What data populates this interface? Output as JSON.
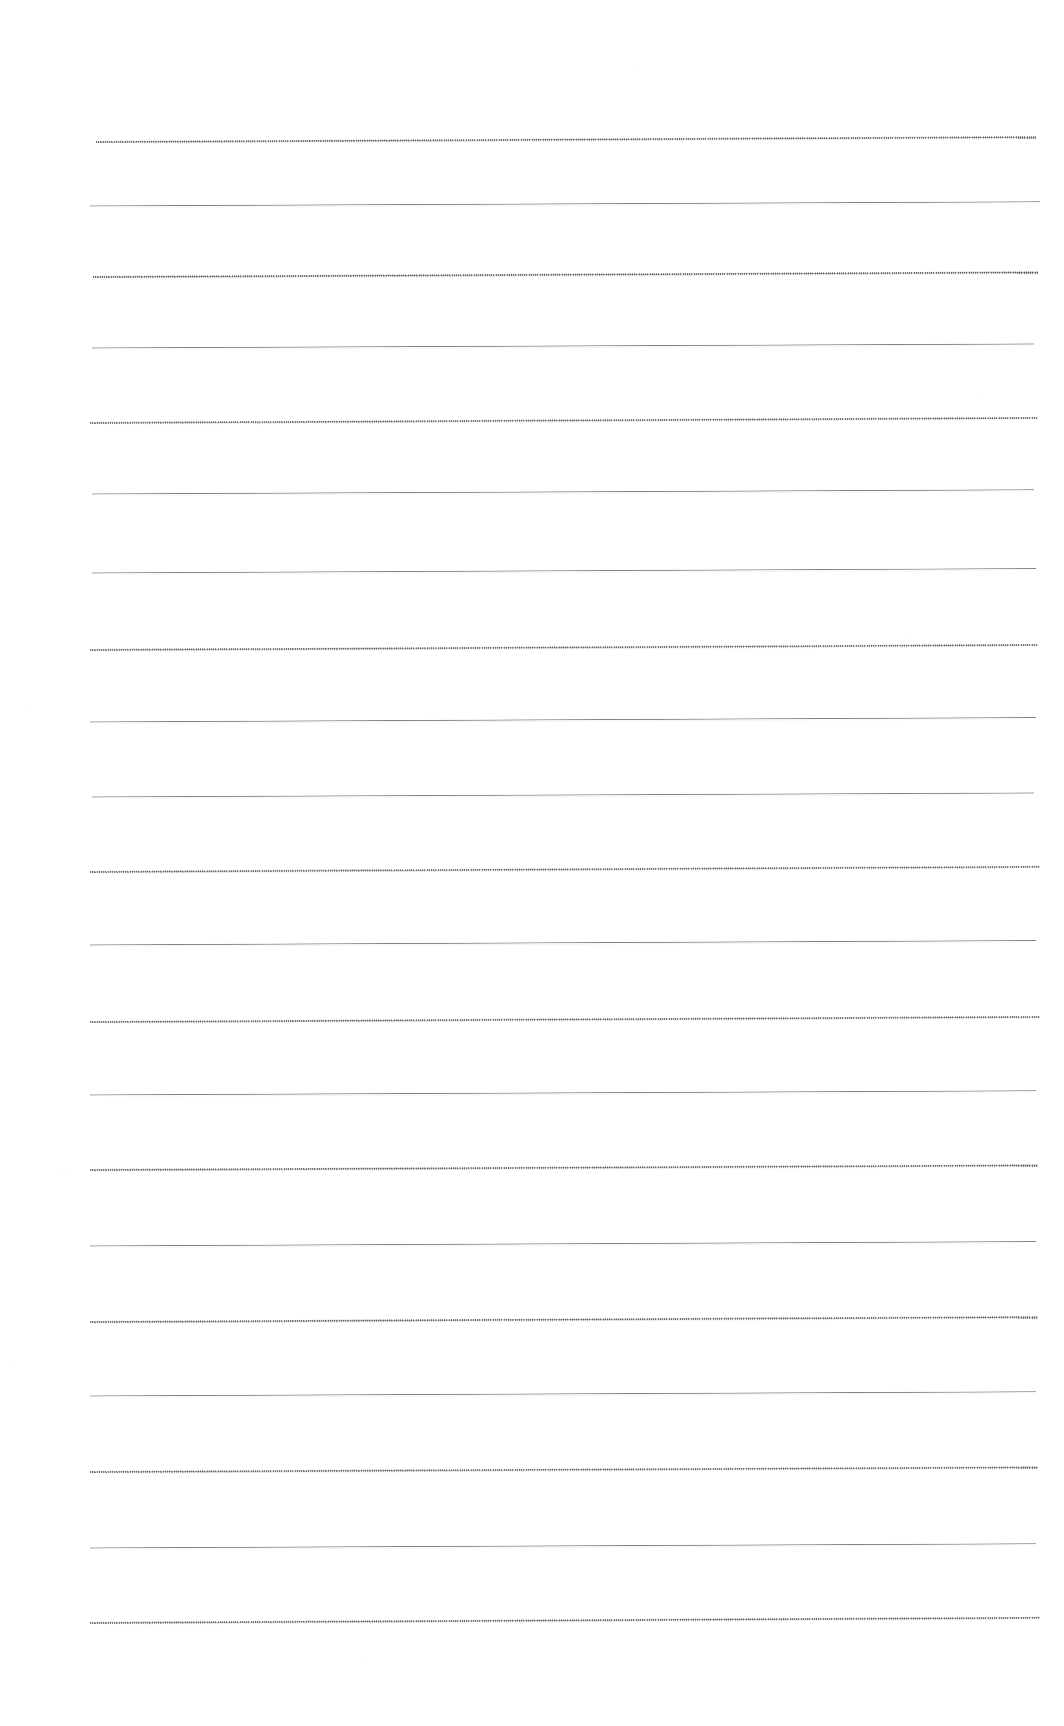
{
  "document": {
    "kind": "lined-paper-scan",
    "title": "Blank lined notebook page",
    "page_width": 1064,
    "page_height": 1726,
    "background_color": "#ffffff",
    "has_text_content": false,
    "visible_text": "",
    "margin": {
      "left": 96,
      "right": 1036,
      "top_first_line": 142,
      "bottom_last_line": 1623
    },
    "ruling": {
      "line_count": 19,
      "line_spacing_px": 82.3,
      "line_color": "#6a6a70",
      "line_thickness_px": 1,
      "line_start_x": 96,
      "line_end_x": 1036,
      "slope_px_over_span": -5,
      "style_note": "alternating fine solid / fine dotted scan texture"
    },
    "lines": [
      {
        "index": 1,
        "y": 142,
        "x_start": 96,
        "x_end": 1036,
        "tilt": -4.8,
        "style": "dotted",
        "opacity": 0.88,
        "content": ""
      },
      {
        "index": 2,
        "y": 206,
        "x_start": 90,
        "x_end": 1040,
        "tilt": -4.2,
        "style": "solid",
        "opacity": 0.92,
        "content": ""
      },
      {
        "index": 3,
        "y": 277,
        "x_start": 93,
        "x_end": 1038,
        "tilt": -4.6,
        "style": "dotted",
        "opacity": 0.9,
        "content": ""
      },
      {
        "index": 4,
        "y": 348,
        "x_start": 92,
        "x_end": 1034,
        "tilt": -4.0,
        "style": "solid",
        "opacity": 0.92,
        "content": ""
      },
      {
        "index": 5,
        "y": 423,
        "x_start": 90,
        "x_end": 1038,
        "tilt": -5.0,
        "style": "dotted",
        "opacity": 0.86,
        "content": ""
      },
      {
        "index": 6,
        "y": 494,
        "x_start": 92,
        "x_end": 1034,
        "tilt": -4.2,
        "style": "solid",
        "opacity": 0.92,
        "content": ""
      },
      {
        "index": 7,
        "y": 573,
        "x_start": 92,
        "x_end": 1036,
        "tilt": -4.4,
        "style": "solid",
        "opacity": 0.9,
        "content": ""
      },
      {
        "index": 8,
        "y": 650,
        "x_start": 90,
        "x_end": 1038,
        "tilt": -5.0,
        "style": "dotted",
        "opacity": 0.86,
        "content": ""
      },
      {
        "index": 9,
        "y": 722,
        "x_start": 90,
        "x_end": 1036,
        "tilt": -4.4,
        "style": "solid",
        "opacity": 0.92,
        "content": ""
      },
      {
        "index": 10,
        "y": 797,
        "x_start": 92,
        "x_end": 1034,
        "tilt": -4.0,
        "style": "solid",
        "opacity": 0.9,
        "content": ""
      },
      {
        "index": 11,
        "y": 872,
        "x_start": 90,
        "x_end": 1040,
        "tilt": -5.2,
        "style": "dotted",
        "opacity": 0.86,
        "content": ""
      },
      {
        "index": 12,
        "y": 945,
        "x_start": 90,
        "x_end": 1036,
        "tilt": -4.4,
        "style": "solid",
        "opacity": 0.92,
        "content": ""
      },
      {
        "index": 13,
        "y": 1022,
        "x_start": 90,
        "x_end": 1040,
        "tilt": -5.0,
        "style": "dotted",
        "opacity": 0.86,
        "content": ""
      },
      {
        "index": 14,
        "y": 1095,
        "x_start": 90,
        "x_end": 1036,
        "tilt": -4.2,
        "style": "solid",
        "opacity": 0.92,
        "content": ""
      },
      {
        "index": 15,
        "y": 1170,
        "x_start": 90,
        "x_end": 1038,
        "tilt": -4.6,
        "style": "dotted",
        "opacity": 0.88,
        "content": ""
      },
      {
        "index": 16,
        "y": 1246,
        "x_start": 90,
        "x_end": 1036,
        "tilt": -4.4,
        "style": "solid",
        "opacity": 0.92,
        "content": ""
      },
      {
        "index": 17,
        "y": 1322,
        "x_start": 90,
        "x_end": 1038,
        "tilt": -4.8,
        "style": "dotted",
        "opacity": 0.88,
        "content": ""
      },
      {
        "index": 18,
        "y": 1396,
        "x_start": 90,
        "x_end": 1036,
        "tilt": -4.2,
        "style": "solid",
        "opacity": 0.92,
        "content": ""
      },
      {
        "index": 19,
        "y": 1623,
        "x_start": 90,
        "x_end": 1040,
        "tilt": -5.2,
        "style": "dotted",
        "opacity": 0.88,
        "content": ""
      }
    ],
    "extra_lines": [
      {
        "index": 20,
        "y": 1472,
        "x_start": 90,
        "x_end": 1038,
        "tilt": -4.6,
        "style": "dotted",
        "opacity": 0.86,
        "content": ""
      },
      {
        "index": 21,
        "y": 1548,
        "x_start": 90,
        "x_end": 1036,
        "tilt": -4.2,
        "style": "solid",
        "opacity": 0.92,
        "content": ""
      }
    ]
  }
}
